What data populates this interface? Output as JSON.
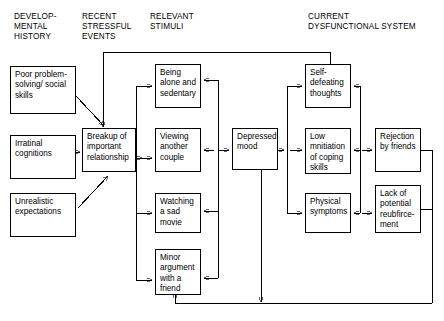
{
  "diagram": {
    "columns": [
      {
        "id": "developmental-history",
        "label": "DEVELOP-\nMENTAL\nHISTORY",
        "x": 14,
        "y": 12
      },
      {
        "id": "recent-stressful-events",
        "label": "RECENT\nSTRESSFUL\nEVENTS",
        "x": 82,
        "y": 12
      },
      {
        "id": "relevant-stimuli",
        "label": "RELEVANT\nSTIMULI",
        "x": 150,
        "y": 12
      },
      {
        "id": "current-dysfunctional-system",
        "label": "CURRENT\nDYSFUNCTIONAL SYSTEM",
        "x": 308,
        "y": 12
      }
    ],
    "nodes": [
      {
        "id": "poor-problem-solving",
        "label": "Poor\nproblem-\nsolving/\nsocial skills",
        "x": 10,
        "y": 66,
        "w": 66,
        "h": 48
      },
      {
        "id": "irrational-cognitions",
        "label": "Irratinal\ncognitions",
        "x": 10,
        "y": 135,
        "w": 66,
        "h": 44
      },
      {
        "id": "unrealistic-expectations",
        "label": "Unrealistic\nexpectations",
        "x": 10,
        "y": 193,
        "w": 66,
        "h": 44
      },
      {
        "id": "breakup-relationship",
        "label": "Breakup of\nimportant\nrelationship",
        "x": 82,
        "y": 128,
        "w": 54,
        "h": 44
      },
      {
        "id": "being-alone-sedentary",
        "label": "Being\nalone and\nsedentary",
        "x": 155,
        "y": 64,
        "w": 46,
        "h": 44
      },
      {
        "id": "viewing-another-couple",
        "label": "Viewing\nanother\ncouple",
        "x": 155,
        "y": 128,
        "w": 46,
        "h": 44
      },
      {
        "id": "watching-sad-movie",
        "label": "Watching a\nsad movie",
        "x": 155,
        "y": 193,
        "w": 46,
        "h": 40
      },
      {
        "id": "minor-argument-friend",
        "label": "Minor\nargument\nwith a\nfriend",
        "x": 155,
        "y": 249,
        "w": 46,
        "h": 46
      },
      {
        "id": "depressed-mood",
        "label": "Depressed\nmood",
        "x": 232,
        "y": 128,
        "w": 46,
        "h": 42
      },
      {
        "id": "self-defeating-thoughts",
        "label": "Self-\ndefeating\nthoughts",
        "x": 305,
        "y": 64,
        "w": 46,
        "h": 44
      },
      {
        "id": "low-initiation-coping",
        "label": "Low\nmnitiation\nof coping\nskills",
        "x": 305,
        "y": 128,
        "w": 46,
        "h": 46
      },
      {
        "id": "physical-symptoms",
        "label": "Physical\nsymptoms",
        "x": 305,
        "y": 193,
        "w": 46,
        "h": 40
      },
      {
        "id": "rejection-by-friends",
        "label": "Rejection\nby friends",
        "x": 375,
        "y": 128,
        "w": 46,
        "h": 44
      },
      {
        "id": "lack-of-reinforcement",
        "label": "Lack of\npotential\nreubfirce-\nment",
        "x": 375,
        "y": 185,
        "w": 46,
        "h": 48
      }
    ],
    "colors": {
      "line": "#000000",
      "box_border": "#000000",
      "background": "#ffffff",
      "text": "#000000"
    },
    "edges": [
      {
        "from": "poor-problem-solving",
        "to": "breakup-relationship",
        "type": "arrow"
      },
      {
        "from": "irrational-cognitions",
        "to": "breakup-relationship",
        "type": "arrow"
      },
      {
        "from": "unrealistic-expectations",
        "to": "breakup-relationship",
        "type": "arrow"
      },
      {
        "from": "feedback-top",
        "to": "breakup-relationship",
        "type": "arrow"
      },
      {
        "from": "breakup-relationship",
        "to": "relevant-stimuli-bus",
        "type": "arrow"
      },
      {
        "from": "relevant-stimuli-bus",
        "to": "being-alone-sedentary",
        "type": "arrow"
      },
      {
        "from": "relevant-stimuli-bus",
        "to": "viewing-another-couple",
        "type": "arrow"
      },
      {
        "from": "relevant-stimuli-bus",
        "to": "watching-sad-movie",
        "type": "arrow"
      },
      {
        "from": "relevant-stimuli-bus",
        "to": "minor-argument-friend",
        "type": "arrow"
      },
      {
        "from": "stimuli-return-bus",
        "to": "being-alone-sedentary",
        "type": "arrow"
      },
      {
        "from": "stimuli-return-bus",
        "to": "watching-sad-movie",
        "type": "arrow"
      },
      {
        "from": "stimuli-return-bus",
        "to": "minor-argument-friend",
        "type": "arrow"
      },
      {
        "from": "viewing-another-couple",
        "to": "depressed-mood",
        "type": "double-arrow"
      },
      {
        "from": "depressed-mood",
        "to": "dysfunction-bus",
        "type": "arrow"
      },
      {
        "from": "dysfunction-bus",
        "to": "self-defeating-thoughts",
        "type": "arrow"
      },
      {
        "from": "dysfunction-bus",
        "to": "low-initiation-coping",
        "type": "double-arrow"
      },
      {
        "from": "dysfunction-bus",
        "to": "physical-symptoms",
        "type": "arrow"
      },
      {
        "from": "self-defeating-thoughts",
        "to": "right-return-bus",
        "type": "arrow"
      },
      {
        "from": "low-initiation-coping",
        "to": "rejection-by-friends",
        "type": "double-arrow"
      },
      {
        "from": "physical-symptoms",
        "to": "lack-of-reinforcement",
        "type": "double-arrow"
      },
      {
        "from": "rejection-by-friends",
        "to": "bottom-feedback-bus",
        "type": "line"
      },
      {
        "from": "lack-of-reinforcement",
        "to": "bottom-feedback-bus",
        "type": "line"
      },
      {
        "from": "bottom-feedback-bus",
        "to": "minor-argument-friend",
        "type": "arrow"
      },
      {
        "from": "depressed-mood",
        "to": "bottom-feedback-bus",
        "type": "arrow"
      },
      {
        "from": "top-feedback-bus",
        "to": "self-defeating-thoughts",
        "type": "line"
      }
    ]
  }
}
